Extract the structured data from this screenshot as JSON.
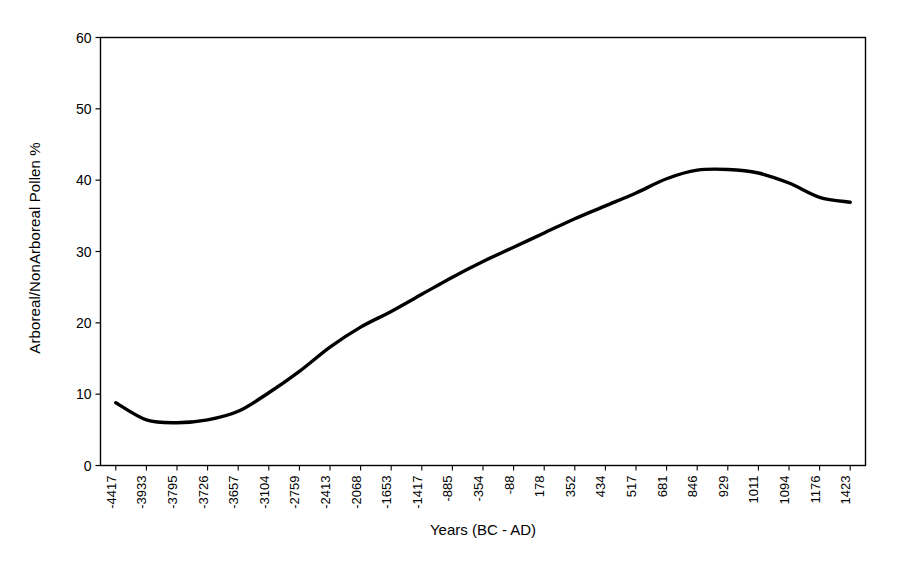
{
  "chart_data": {
    "type": "line",
    "title": "",
    "xlabel": "Years (BC - AD)",
    "ylabel": "Arboreal/NonArboreal Pollen %",
    "ylim": [
      0,
      60
    ],
    "yticks": [
      0,
      10,
      20,
      30,
      40,
      50,
      60
    ],
    "grid": false,
    "legend": "none",
    "categories": [
      "-4417",
      "-3933",
      "-3795",
      "-3726",
      "-3657",
      "-3104",
      "-2759",
      "-2413",
      "-2068",
      "-1653",
      "-1417",
      "-885",
      "-354",
      "-88",
      "178",
      "352",
      "434",
      "517",
      "681",
      "846",
      "929",
      "1011",
      "1094",
      "1176",
      "1423"
    ],
    "series": [
      {
        "name": "Arboreal/NonArboreal Pollen %",
        "color": "#000000",
        "values": [
          8.8,
          6.4,
          6.0,
          6.4,
          7.6,
          10.2,
          13.2,
          16.6,
          19.4,
          21.6,
          24.0,
          26.4,
          28.6,
          30.6,
          32.6,
          34.6,
          36.4,
          38.2,
          40.2,
          41.4,
          41.5,
          41.0,
          39.6,
          37.6,
          36.9
        ]
      }
    ]
  },
  "axis": {
    "y_tick_labels": [
      "60",
      "50",
      "40",
      "30",
      "20",
      "10",
      "0"
    ],
    "y_title": "Arboreal/NonArboreal Pollen %",
    "x_title": "Years (BC - AD)"
  }
}
